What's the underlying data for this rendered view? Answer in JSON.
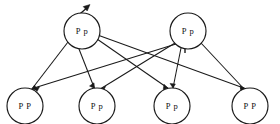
{
  "diagram": {
    "type": "genetic-cross-diagram",
    "background_color": "#ffffff",
    "stroke_color": "#1a1a1a",
    "parents": [
      {
        "id": "parent-left",
        "label": "P p",
        "allele_dominant": "P",
        "allele_recessive": "p",
        "cx": 82,
        "cy": 31,
        "r": 18,
        "has_emerging_arrow": true
      },
      {
        "id": "parent-right",
        "label": "P p",
        "allele_dominant": "P",
        "allele_recessive": "p",
        "cx": 188,
        "cy": 31,
        "r": 18,
        "has_cross_mark": true
      }
    ],
    "offspring": [
      {
        "id": "offspring-1",
        "label": "P P",
        "cx": 25,
        "cy": 106,
        "r": 18
      },
      {
        "id": "offspring-2",
        "label": "P p",
        "cx": 97,
        "cy": 106,
        "r": 18
      },
      {
        "id": "offspring-3",
        "label": "P p",
        "cx": 172,
        "cy": 106,
        "r": 18
      },
      {
        "id": "offspring-4",
        "label": "P P",
        "cx": 250,
        "cy": 106,
        "r": 18
      }
    ],
    "edges": [
      {
        "from": "parent-left",
        "to": "offspring-1",
        "arrow": true
      },
      {
        "from": "parent-left",
        "to": "offspring-2",
        "arrow": true
      },
      {
        "from": "parent-left",
        "to": "offspring-3",
        "arrow": true
      },
      {
        "from": "parent-left",
        "to": "offspring-4",
        "arrow": true
      },
      {
        "from": "parent-right",
        "to": "offspring-1",
        "arrow": true
      },
      {
        "from": "parent-right",
        "to": "offspring-2",
        "arrow": true
      },
      {
        "from": "parent-right",
        "to": "offspring-3",
        "arrow": true
      },
      {
        "from": "parent-right",
        "to": "offspring-4",
        "arrow": true
      }
    ],
    "annotations": {
      "emerging_arrow": {
        "name": "emerging-arrow",
        "from_x": 72,
        "from_y": 20,
        "to_x": 90,
        "to_y": 5
      },
      "cross_mark": {
        "name": "cross-mark",
        "symbol": "+",
        "x": 185,
        "y": 47
      }
    }
  }
}
